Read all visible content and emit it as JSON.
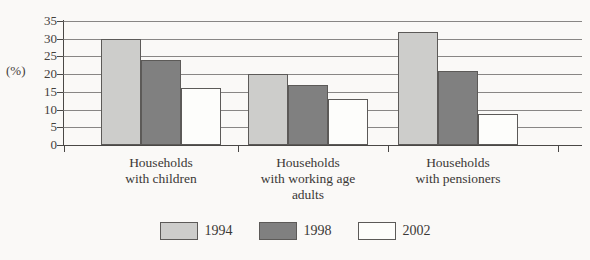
{
  "chart_data": {
    "type": "bar",
    "title": "",
    "xlabel": "",
    "ylabel": "(%)",
    "ylim": [
      0,
      35
    ],
    "yticks": [
      0,
      5,
      10,
      15,
      20,
      25,
      30,
      35
    ],
    "grid": true,
    "legend_position": "bottom",
    "categories": [
      "Households\nwith children",
      "Households\nwith working age\nadults",
      "Households\nwith pensioners"
    ],
    "category_lines": [
      [
        "Households",
        "with children"
      ],
      [
        "Households",
        "with working age",
        "adults"
      ],
      [
        "Households",
        "with pensioners"
      ]
    ],
    "series": [
      {
        "name": "1994",
        "color": "#cdcdcb",
        "values": [
          30,
          20,
          32
        ]
      },
      {
        "name": "1998",
        "color": "#808080",
        "values": [
          24,
          17,
          21
        ]
      },
      {
        "name": "2002",
        "color": "#fdfdfb",
        "values": [
          16,
          13,
          8.7
        ]
      }
    ]
  },
  "axis": {
    "unit_label": "(%)",
    "tick_labels": [
      "35",
      "30",
      "25",
      "20",
      "15",
      "10",
      "5",
      "0"
    ]
  },
  "legend": {
    "items": [
      {
        "label": "1994",
        "swatch": "light-gray"
      },
      {
        "label": "1998",
        "swatch": "dark-gray"
      },
      {
        "label": "2002",
        "swatch": "white"
      }
    ]
  }
}
